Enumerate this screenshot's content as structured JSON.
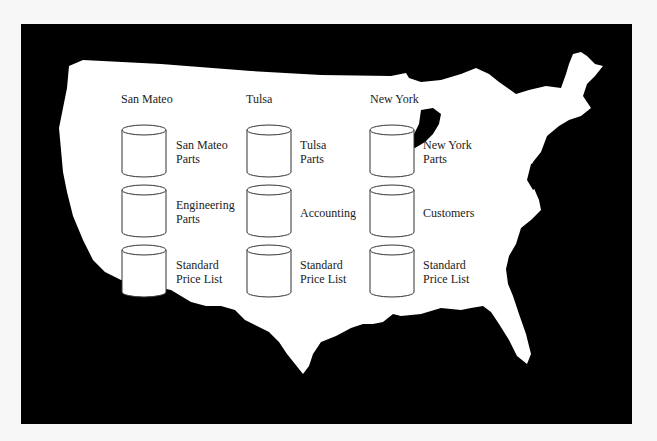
{
  "diagram": {
    "type": "distributed-database-map",
    "background_map": "united-states-silhouette",
    "colors": {
      "map_land": "#ffffff",
      "map_background": "#000000",
      "text": "#222222"
    },
    "sites": [
      {
        "name": "San Mateo",
        "databases": [
          "San Mateo\nParts",
          "Engineering\nParts",
          "Standard\nPrice List"
        ]
      },
      {
        "name": "Tulsa",
        "databases": [
          "Tulsa\nParts",
          "Accounting",
          "Standard\nPrice List"
        ]
      },
      {
        "name": "New York",
        "databases": [
          "New York\nParts",
          "Customers",
          "Standard\nPrice List"
        ]
      }
    ]
  }
}
